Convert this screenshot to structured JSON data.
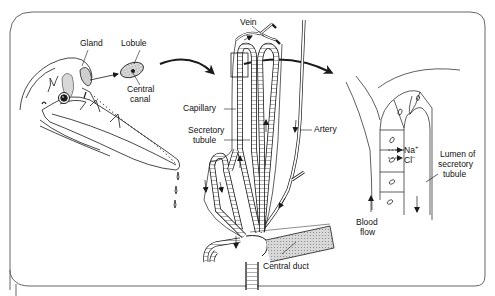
{
  "figure": {
    "labels": {
      "gland": "Gland",
      "lobule": "Lobule",
      "central_canal_1": "Central",
      "central_canal_2": "canal",
      "vein": "Vein",
      "capillary": "Capillary",
      "secretory_tubule_1": "Secretory",
      "secretory_tubule_2": "tubule",
      "artery": "Artery",
      "central_duct": "Central duct",
      "na_ion": "Na",
      "na_charge": "+",
      "cl_ion": "Cl",
      "cl_charge": "−",
      "lumen_1": "Lumen of",
      "lumen_2": "secretory",
      "lumen_3": "tubule",
      "blood_flow_1": "Blood",
      "blood_flow_2": "flow"
    },
    "colors": {
      "line": "#1a1a1a",
      "frame": "#555555",
      "shade": "#bdbdbd",
      "background": "#ffffff"
    }
  }
}
